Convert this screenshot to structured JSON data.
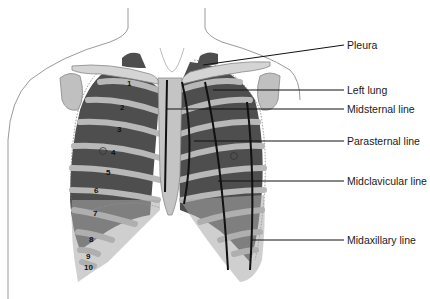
{
  "diagram": {
    "labels": [
      {
        "id": "pleura",
        "text": "Pleura",
        "y": 45
      },
      {
        "id": "left-lung",
        "text": "Left lung",
        "y": 90
      },
      {
        "id": "midsternal",
        "text": "Midsternal line",
        "y": 109
      },
      {
        "id": "parasternal",
        "text": "Parasternal line",
        "y": 141
      },
      {
        "id": "midclavicular",
        "text": "Midclavicular line",
        "y": 181
      },
      {
        "id": "midaxillary",
        "text": "Midaxillary line",
        "y": 240
      }
    ],
    "rib_numbers": [
      "1",
      "2",
      "3",
      "4",
      "5",
      "6",
      "7",
      "8",
      "9",
      "10"
    ],
    "colors": {
      "skin_outline": "#9a9a9a",
      "bone": "#c8c8c8",
      "lung_dark": "#4a4a4a",
      "cartilage": "#b0b0b0",
      "leader_line": "#111111"
    }
  }
}
